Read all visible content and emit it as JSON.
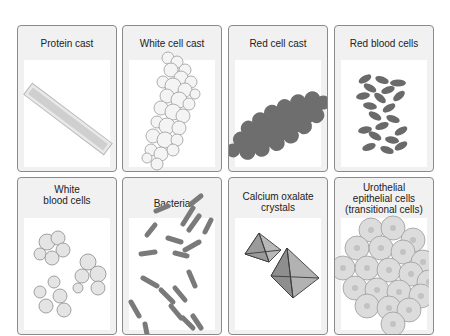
{
  "figure": {
    "panels": [
      {
        "id": "protein-cast",
        "label": "Protein cast"
      },
      {
        "id": "white-cell-cast",
        "label": "White cell cast"
      },
      {
        "id": "red-cell-cast",
        "label": "Red cell cast"
      },
      {
        "id": "red-blood-cells",
        "label": "Red blood cells"
      },
      {
        "id": "white-blood-cells",
        "label_line1": "White",
        "label_line2": "blood cells"
      },
      {
        "id": "bacteria",
        "label": "Bacteria"
      },
      {
        "id": "calcium-oxalate-crystals",
        "label_line1": "Calcium oxalate",
        "label_line2": "crystals"
      },
      {
        "id": "urothelial-epithelial-cells",
        "label_line1": "Urothelial",
        "label_line2": "epithelial cells",
        "label_line3": "(transitional cells)"
      }
    ],
    "colors": {
      "panel_border": "#8a8a8a",
      "panel_bg": "#f1f1f1",
      "cast_fill": "#d6d6d6",
      "rbc_fill": "#6f6f6f",
      "bacteria_fill": "#7a7a7a",
      "urothelial_fill": "#d9d9d9"
    }
  }
}
